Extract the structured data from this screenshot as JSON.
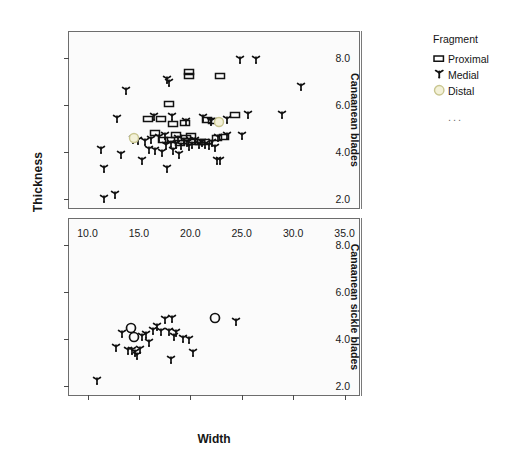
{
  "chart_data": {
    "type": "scatter",
    "title": "",
    "xlabel": "Width",
    "ylabel": "Thickness",
    "xlim": [
      8.2,
      36.6
    ],
    "ylim": [
      1.55,
      9.1
    ],
    "xticks": [
      "10.0",
      "15.0",
      "20.0",
      "25.0",
      "30.0",
      "35.0"
    ],
    "xtick_values": [
      10,
      15,
      20,
      25,
      30,
      35
    ],
    "yticks": [
      "2.0",
      "4.0",
      "6.0",
      "8.0"
    ],
    "ytick_values": [
      2,
      4,
      6,
      8
    ],
    "grid": false,
    "legend_position": "right",
    "legend": {
      "title": "Fragment",
      "entries": [
        {
          "label": "Proximal",
          "marker": "rectangle-outline",
          "color": "#1a1a1a"
        },
        {
          "label": "Medial",
          "marker": "tri-spoke",
          "color": "#1a1a1a"
        },
        {
          "label": "Distal",
          "marker": "circle-outline",
          "color": "#e8e6c0"
        }
      ],
      "more": "..."
    },
    "panels": [
      {
        "name": "Canaanean blades",
        "series": [
          {
            "name": "Proximal",
            "marker": "rectangle-outline",
            "points": [
              [
                19.9,
                7.42
              ],
              [
                19.9,
                7.22
              ],
              [
                22.9,
                7.22
              ],
              [
                17.9,
                6.05
              ],
              [
                15.9,
                5.43
              ],
              [
                17.1,
                5.43
              ],
              [
                18.3,
                5.18
              ],
              [
                19.5,
                5.25
              ],
              [
                21.6,
                5.35
              ],
              [
                22.2,
                5.32
              ],
              [
                24.3,
                5.58
              ],
              [
                18.6,
                4.72
              ],
              [
                19.6,
                4.62
              ],
              [
                20.3,
                4.44
              ],
              [
                20.9,
                4.45
              ],
              [
                21.4,
                4.42
              ],
              [
                22.6,
                4.62
              ],
              [
                23.3,
                4.66
              ],
              [
                17.3,
                4.5
              ],
              [
                18.0,
                4.52
              ],
              [
                19.0,
                4.4
              ],
              [
                20.1,
                4.7
              ],
              [
                16.6,
                4.8
              ]
            ]
          },
          {
            "name": "Medial",
            "marker": "tri-spoke",
            "points": [
              [
                24.8,
                7.92
              ],
              [
                26.4,
                7.92
              ],
              [
                30.8,
                6.78
              ],
              [
                13.7,
                6.6
              ],
              [
                17.7,
                7.08
              ],
              [
                17.9,
                6.92
              ],
              [
                12.9,
                5.43
              ],
              [
                16.5,
                5.5
              ],
              [
                18.2,
                5.48
              ],
              [
                19.6,
                5.28
              ],
              [
                21.2,
                5.45
              ],
              [
                22.0,
                5.3
              ],
              [
                23.6,
                5.35
              ],
              [
                25.6,
                5.58
              ],
              [
                28.9,
                5.58
              ],
              [
                11.3,
                4.1
              ],
              [
                11.6,
                3.27
              ],
              [
                13.3,
                3.9
              ],
              [
                14.4,
                4.5
              ],
              [
                15.3,
                3.62
              ],
              [
                16.0,
                4.1
              ],
              [
                16.6,
                4.05
              ],
              [
                17.0,
                4.62
              ],
              [
                17.5,
                4.7
              ],
              [
                17.6,
                4.28
              ],
              [
                18.1,
                4.35
              ],
              [
                18.3,
                4.05
              ],
              [
                18.6,
                4.3
              ],
              [
                18.8,
                4.58
              ],
              [
                19.1,
                4.28
              ],
              [
                19.4,
                4.48
              ],
              [
                19.7,
                4.4
              ],
              [
                19.9,
                4.22
              ],
              [
                20.2,
                4.32
              ],
              [
                20.5,
                4.48
              ],
              [
                20.8,
                4.3
              ],
              [
                21.1,
                4.4
              ],
              [
                21.4,
                4.3
              ],
              [
                21.8,
                4.25
              ],
              [
                22.1,
                4.38
              ],
              [
                22.4,
                4.18
              ],
              [
                22.7,
                4.62
              ],
              [
                23.6,
                4.7
              ],
              [
                25.0,
                4.7
              ],
              [
                17.7,
                3.28
              ],
              [
                22.6,
                3.62
              ],
              [
                22.9,
                3.62
              ],
              [
                11.6,
                2.02
              ],
              [
                12.7,
                2.2
              ],
              [
                14.9,
                4.48
              ],
              [
                15.6,
                4.42
              ],
              [
                16.2,
                4.52
              ],
              [
                17.2,
                3.95
              ],
              [
                18.9,
                3.88
              ]
            ]
          },
          {
            "name": "Distal",
            "marker": "circle-outline",
            "points": [
              [
                14.5,
                4.62
              ],
              [
                22.8,
                5.28
              ]
            ]
          }
        ]
      },
      {
        "name": "Canaanean sickle blades",
        "series": [
          {
            "name": "Proximal",
            "marker": "rectangle-outline",
            "points": []
          },
          {
            "name": "Medial",
            "marker": "tri-spoke",
            "points": [
              [
                10.9,
                2.22
              ],
              [
                12.8,
                3.62
              ],
              [
                13.4,
                4.22
              ],
              [
                13.9,
                3.52
              ],
              [
                14.3,
                3.5
              ],
              [
                14.6,
                3.42
              ],
              [
                14.8,
                3.3
              ],
              [
                15.1,
                3.55
              ],
              [
                15.3,
                4.08
              ],
              [
                15.7,
                4.2
              ],
              [
                16.0,
                3.85
              ],
              [
                16.4,
                4.35
              ],
              [
                16.8,
                4.52
              ],
              [
                17.1,
                4.3
              ],
              [
                17.5,
                4.82
              ],
              [
                17.9,
                4.3
              ],
              [
                18.2,
                4.85
              ],
              [
                18.4,
                4.1
              ],
              [
                18.1,
                3.1
              ],
              [
                18.6,
                4.28
              ],
              [
                19.3,
                4.02
              ],
              [
                19.9,
                3.95
              ],
              [
                20.3,
                3.4
              ],
              [
                24.4,
                4.72
              ]
            ]
          },
          {
            "name": "Distal",
            "marker": "circle-outline-dark",
            "points": [
              [
                14.2,
                4.48
              ],
              [
                14.5,
                4.1
              ],
              [
                22.4,
                4.9
              ]
            ]
          }
        ]
      }
    ]
  }
}
